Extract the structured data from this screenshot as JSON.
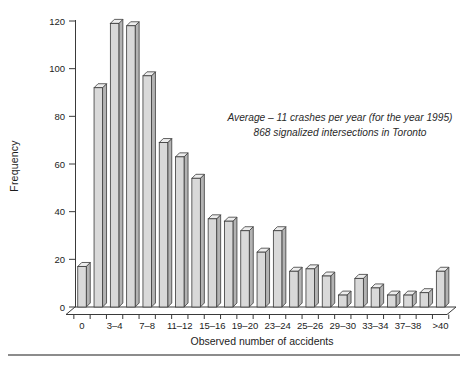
{
  "chart_data": {
    "type": "bar",
    "title": "",
    "xlabel": "Observed number of accidents",
    "ylabel": "Frequency",
    "ylim": [
      0,
      120
    ],
    "yticks": [
      0,
      20,
      40,
      60,
      80,
      100,
      120
    ],
    "grid": false,
    "legend": null,
    "style": "3d-column-histogram",
    "annotation": {
      "line1": "Average – 11 crashes per year (for the year 1995)",
      "line2": "868 signalized intersections in Toronto"
    },
    "x_tick_labels": [
      "0",
      "3–4",
      "7–8",
      "11–12",
      "15–16",
      "19–20",
      "23–24",
      "25–26",
      "29–30",
      "33–34",
      "37–38",
      ">40"
    ],
    "values": [
      17,
      92,
      119,
      118,
      97,
      69,
      63,
      54,
      37,
      36,
      32,
      23,
      32,
      15,
      16,
      13,
      5,
      12,
      8,
      5,
      5,
      6,
      15
    ],
    "note": "23 bars; every second bar carries an x tick label",
    "colors": {
      "bar_front": "#d9d9d9",
      "bar_top": "#ededed",
      "bar_side": "#b3b3b3",
      "outline": "#3a3a3a",
      "text": "#1c1c1c",
      "bottom_rule": "#8c8c8c"
    }
  }
}
